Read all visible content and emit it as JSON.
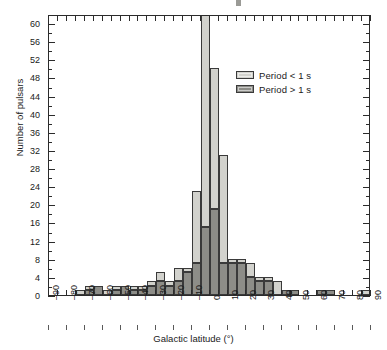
{
  "axes": {
    "ylabel": "Number of pulsars",
    "xlabel": "Galactic latitude (°)",
    "y_ticks": [
      0,
      4,
      8,
      12,
      16,
      20,
      24,
      28,
      32,
      36,
      40,
      44,
      48,
      52,
      56,
      60
    ],
    "x_ticks": [
      "90",
      "80",
      "70",
      "60",
      "50",
      "40",
      "30",
      "20",
      "10",
      "0",
      "10",
      "20",
      "30",
      "40",
      "50",
      "60",
      "70",
      "80",
      "90"
    ],
    "x_tick_values": [
      -90,
      -80,
      -70,
      -60,
      -50,
      -40,
      -30,
      -20,
      -10,
      0,
      10,
      20,
      30,
      40,
      50,
      60,
      70,
      80,
      90
    ],
    "ymin": 0,
    "ymax": 62,
    "xmin": -90,
    "xmax": 90
  },
  "legend": {
    "position": "top-right-inside",
    "entries": [
      {
        "label": "Period < 1 s",
        "color": "#d2d2cd",
        "key": "short"
      },
      {
        "label": "Period > 1 s",
        "color": "#8d8d88",
        "key": "long"
      }
    ]
  },
  "colors": {
    "short_period": "#d2d2cd",
    "long_period": "#8d8d88",
    "axis": "#2b2b2b",
    "background": "#ffffff"
  },
  "chart_data": {
    "type": "bar",
    "subtype": "stacked-histogram",
    "title": "",
    "xlabel": "Galactic latitude (°)",
    "ylabel": "Number of pulsars",
    "xlim": [
      -90,
      90
    ],
    "ylim": [
      0,
      62
    ],
    "grid": false,
    "bin_width": 5,
    "legend_position": "upper right",
    "bin_centers": [
      -87.5,
      -82.5,
      -77.5,
      -72.5,
      -67.5,
      -62.5,
      -57.5,
      -52.5,
      -47.5,
      -42.5,
      -37.5,
      -32.5,
      -27.5,
      -22.5,
      -17.5,
      -12.5,
      -7.5,
      -2.5,
      2.5,
      7.5,
      12.5,
      17.5,
      22.5,
      27.5,
      32.5,
      37.5,
      42.5,
      47.5,
      52.5,
      57.5,
      62.5,
      67.5,
      72.5,
      77.5,
      82.5,
      87.5
    ],
    "bin_edges": [
      -90,
      -85,
      -80,
      -75,
      -70,
      -65,
      -60,
      -55,
      -50,
      -45,
      -40,
      -35,
      -30,
      -25,
      -20,
      -15,
      -10,
      -5,
      0,
      5,
      10,
      15,
      20,
      25,
      30,
      35,
      40,
      45,
      50,
      55,
      60,
      65,
      70,
      75,
      80,
      85,
      90
    ],
    "series": [
      {
        "name": "Period < 1 s",
        "color": "#d2d2cd",
        "values": [
          0,
          0,
          0,
          1,
          1,
          0,
          1,
          1,
          0,
          1,
          1,
          1,
          2,
          1,
          3,
          1,
          16,
          47,
          31,
          24,
          1,
          1,
          3,
          1,
          1,
          3,
          0,
          0,
          0,
          0,
          0,
          0,
          0,
          0,
          0,
          1
        ]
      },
      {
        "name": "Period > 1 s",
        "color": "#8d8d88",
        "values": [
          0,
          0,
          0,
          0,
          1,
          2,
          0,
          1,
          2,
          1,
          1,
          2,
          3,
          2,
          3,
          5,
          7,
          15,
          19,
          7,
          7,
          7,
          4,
          3,
          3,
          0,
          1,
          1,
          0,
          0,
          1,
          1,
          0,
          0,
          0,
          0
        ]
      }
    ],
    "totals": [
      0,
      0,
      0,
      1,
      2,
      2,
      1,
      2,
      2,
      2,
      2,
      3,
      5,
      3,
      6,
      6,
      23,
      62,
      50,
      31,
      8,
      8,
      7,
      4,
      4,
      3,
      1,
      1,
      0,
      0,
      1,
      1,
      0,
      0,
      0,
      1
    ]
  }
}
